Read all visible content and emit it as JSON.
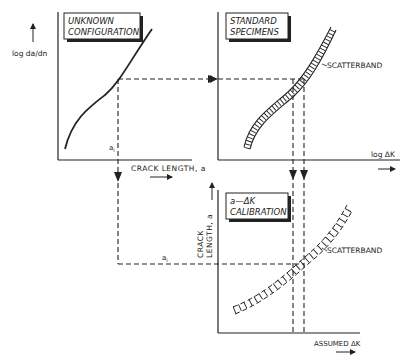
{
  "panels": {
    "unknown": {
      "title_line1": "UNKNOWN",
      "title_line2": "CONFIGURATION",
      "y_label": "log da/dn",
      "x_label": "CRACK LENGTH, a",
      "point_label": "a",
      "point_subscript": "i"
    },
    "standard": {
      "title_line1": "STANDARD",
      "title_line2": "SPECIMENS",
      "band_label": "SCATTERBAND",
      "x_label": "log ΔK"
    },
    "calibration": {
      "title_line1": "a—ΔK",
      "title_line2": "CALIBRATION",
      "y_label_line1": "CRACK",
      "y_label_line2": "LENGTH, a",
      "band_label": "SCATTERBAND",
      "x_label": "ASSUMED ΔK",
      "point_label": "a",
      "point_subscript": "i"
    }
  },
  "colors": {
    "ink": "#222222",
    "background": "#ffffff"
  }
}
